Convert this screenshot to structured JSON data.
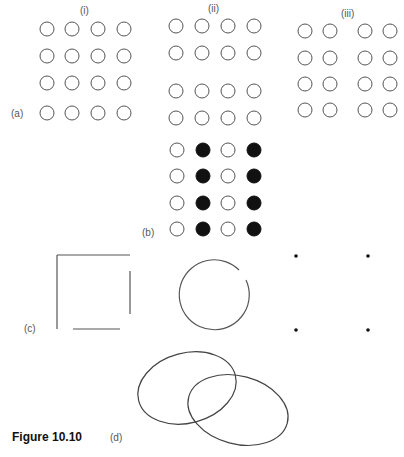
{
  "figure": {
    "caption": "Figure 10.10",
    "panel_labels": {
      "a": "(a)",
      "b": "(b)",
      "c": "(c)",
      "d": "(d)"
    },
    "column_labels": {
      "i": "(i)",
      "ii": "(ii)",
      "iii": "(iii)"
    }
  },
  "panels": {
    "a_i": {
      "desc": "4x4 evenly spaced open circles",
      "xs": [
        47,
        72,
        98,
        124
      ],
      "ys": [
        29,
        56,
        83,
        113
      ]
    },
    "a_ii": {
      "desc": "4x4 open circles grouped into two row-pairs",
      "xs": [
        176,
        202,
        228,
        254
      ],
      "ys": [
        26,
        53,
        91,
        118
      ]
    },
    "a_iii": {
      "desc": "4x4 open circles grouped into two column-pairs",
      "xs": [
        305,
        330,
        365,
        390
      ],
      "ys": [
        31,
        58,
        84,
        110
      ]
    },
    "b": {
      "desc": "4x4 circles, columns alternate open/filled",
      "xs": [
        177,
        203,
        228,
        254
      ],
      "ys": [
        150,
        176,
        203,
        229
      ],
      "filled_columns": [
        1,
        3
      ]
    },
    "c": {
      "desc": "incomplete square, broken circle, four dots at square corners"
    },
    "d": {
      "desc": "two overlapping ellipses"
    }
  },
  "colors": {
    "stroke": "#555555",
    "fill_dark": "#111111"
  }
}
